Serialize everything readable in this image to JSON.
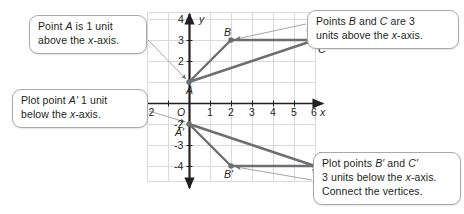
{
  "figure": {
    "type": "coordinate-plane-reflection-diagram",
    "grid": {
      "x_min": -2,
      "x_max": 6,
      "y_min": -4,
      "y_max": 4,
      "unit_px": 21,
      "origin_label": "O",
      "x_axis_label": "x",
      "y_axis_label": "y",
      "x_tick_labels": [
        "-2",
        "1",
        "2",
        "3",
        "4",
        "5",
        "6"
      ],
      "y_tick_labels": [
        "4",
        "3",
        "2",
        "-2",
        "-3",
        "-4"
      ],
      "grid_color": "#d9dadb",
      "axis_color": "#231f20"
    },
    "shapes": [
      {
        "name": "triangle-abc",
        "color": "#6d6e71",
        "vertices": [
          {
            "label": "A",
            "x": 0,
            "y": 1
          },
          {
            "label": "B",
            "x": 2,
            "y": 3
          },
          {
            "label": "C",
            "x": 6,
            "y": 3
          }
        ]
      },
      {
        "name": "triangle-a-prime-b-prime-c-prime",
        "color": "#6d6e71",
        "vertices": [
          {
            "label": "A′",
            "x": 0,
            "y": -1
          },
          {
            "label": "B′",
            "x": 2,
            "y": -3
          },
          {
            "label": "C′",
            "x": 6,
            "y": -3
          }
        ]
      }
    ],
    "point_labels": [
      {
        "name": "point-label-a",
        "text": "A"
      },
      {
        "name": "point-label-b",
        "text": "B"
      },
      {
        "name": "point-label-c",
        "text": "C"
      },
      {
        "name": "point-label-a-prime",
        "text": "A′"
      },
      {
        "name": "point-label-b-prime",
        "text": "B′"
      },
      {
        "name": "point-label-c-prime",
        "text": "C′"
      }
    ]
  },
  "callouts": [
    {
      "name": "callout-point-a",
      "lines": [
        "Point A is 1 unit",
        "above the x-axis."
      ]
    },
    {
      "name": "callout-points-b-c",
      "lines": [
        "Points B and C are 3",
        "units above the x-axis."
      ]
    },
    {
      "name": "callout-plot-a-prime",
      "lines": [
        "Plot point A′ 1 unit",
        "below the x-axis."
      ]
    },
    {
      "name": "callout-plot-b-prime-c-prime",
      "lines": [
        "Plot points B′ and C′",
        "3 units below the x-axis.",
        "Connect the vertices."
      ]
    }
  ]
}
